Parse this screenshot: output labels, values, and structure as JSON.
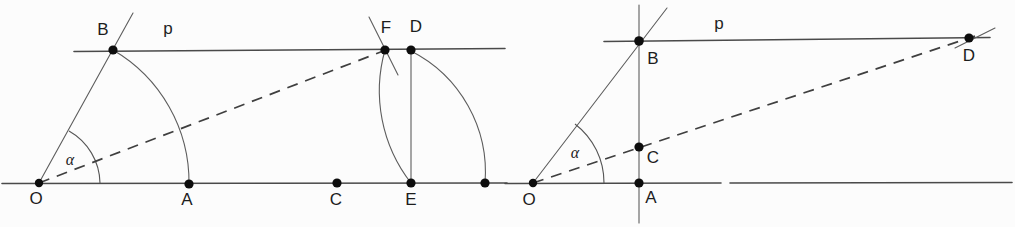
{
  "figure": {
    "background_color": "#fcfcfc",
    "line_color": "#4a4a4a",
    "dash_color": "#3f3f3f",
    "dot_color": "#0d0d0d",
    "panels": [
      {
        "id": "left-panel",
        "name": "left-construction",
        "labels": {
          "origin": "O",
          "vertex_b": "B",
          "point_a": "A",
          "point_c": "C",
          "point_d": "D",
          "point_e": "E",
          "point_f": "F",
          "line_p": "p",
          "angle": "α"
        },
        "points": [
          {
            "name": "O",
            "label": "O",
            "x": 39,
            "y": 183,
            "label_x": 36,
            "label_y": 204,
            "labeled": true
          },
          {
            "name": "B",
            "label": "B",
            "x": 113,
            "y": 50,
            "label_x": 103,
            "label_y": 35,
            "labeled": true
          },
          {
            "name": "A",
            "label": "A",
            "x": 189,
            "y": 184,
            "label_x": 184,
            "label_y": 205,
            "labeled": true
          },
          {
            "name": "C",
            "label": "C",
            "x": 337,
            "y": 183,
            "label_x": 331,
            "label_y": 205,
            "labeled": true
          },
          {
            "name": "F",
            "label": "F",
            "x": 385,
            "y": 50,
            "label_x": 382,
            "label_y": 33,
            "labeled": true
          },
          {
            "name": "D",
            "label": "D",
            "x": 411,
            "y": 50,
            "label_x": 413,
            "label_y": 32,
            "labeled": true
          },
          {
            "name": "E",
            "label": "E",
            "x": 411,
            "y": 183,
            "label_x": 405,
            "label_y": 205,
            "labeled": true
          },
          {
            "name": "G",
            "label": "",
            "x": 485,
            "y": 183,
            "label_x": 0,
            "label_y": 0,
            "labeled": false
          }
        ],
        "line_p_label": {
          "text": "p",
          "x": 168,
          "y": 34
        }
      },
      {
        "id": "right-panel",
        "name": "right-construction",
        "labels": {
          "origin": "O",
          "vertex_b": "B",
          "point_a": "A",
          "point_c": "C",
          "point_d": "D",
          "line_p": "p",
          "angle": "α"
        },
        "points": [
          {
            "name": "O",
            "label": "O",
            "x": 533,
            "y": 183,
            "label_x": 527,
            "label_y": 205,
            "labeled": true
          },
          {
            "name": "B",
            "label": "B",
            "x": 639,
            "y": 41,
            "label_x": 649,
            "label_y": 64,
            "labeled": true
          },
          {
            "name": "C",
            "label": "C",
            "x": 639,
            "y": 147,
            "label_x": 649,
            "label_y": 163,
            "labeled": true
          },
          {
            "name": "A",
            "label": "A",
            "x": 639,
            "y": 183,
            "label_x": 648,
            "label_y": 203,
            "labeled": true
          },
          {
            "name": "D",
            "label": "D",
            "x": 969,
            "y": 38,
            "label_x": 964,
            "label_y": 61,
            "labeled": true
          }
        ],
        "line_p_label": {
          "text": "p",
          "x": 719,
          "y": 29
        }
      }
    ]
  }
}
